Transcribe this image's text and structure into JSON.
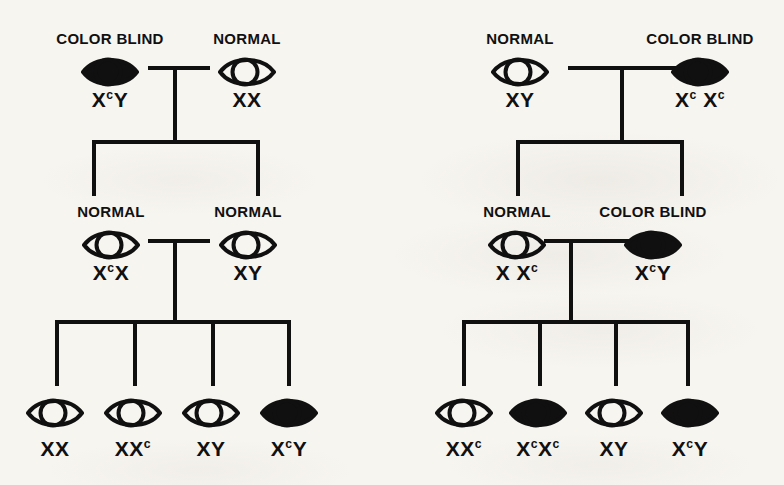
{
  "diagram": {
    "ink_color": "#111010",
    "paper_color": "#f7f5f0",
    "phenotype_labels": {
      "normal": "NORMAL",
      "color_blind": "COLOR BLIND"
    },
    "symbol_legend": {
      "open_eye": "normal vision",
      "filled_eye": "color blind"
    }
  },
  "pedigrees": [
    {
      "id": "left",
      "name": "pedigree-left",
      "generations": [
        {
          "id": "P",
          "individuals": [
            {
              "id": "left-p-father",
              "name": "color-blind-father",
              "phenotype": "COLOR BLIND",
              "genotype_main": "X",
              "genotype_sup": "c",
              "genotype_tail": "Y",
              "genotype_text": "XcY",
              "filled": true,
              "cx": 110,
              "eye_y": 55,
              "phen_y": 30,
              "geno_y": 88
            },
            {
              "id": "left-p-mother",
              "name": "normal-mother",
              "phenotype": "NORMAL",
              "genotype_main": "XX",
              "genotype_sup": "",
              "genotype_tail": "",
              "genotype_text": "XX",
              "filled": false,
              "cx": 247,
              "eye_y": 55,
              "phen_y": 30,
              "geno_y": 88
            }
          ]
        },
        {
          "id": "F1",
          "individuals": [
            {
              "id": "left-f1-mother",
              "name": "normal-carrier-daughter",
              "phenotype": "NORMAL",
              "genotype_main": "X",
              "genotype_sup": "c",
              "genotype_tail": "X",
              "genotype_text": "XcX",
              "filled": false,
              "cx": 111,
              "eye_y": 228,
              "phen_y": 203,
              "geno_y": 261
            },
            {
              "id": "left-f1-father",
              "name": "normal-father-in-law",
              "phenotype": "NORMAL",
              "genotype_main": "XY",
              "genotype_sup": "",
              "genotype_tail": "",
              "genotype_text": "XY",
              "filled": false,
              "cx": 248,
              "eye_y": 228,
              "phen_y": 203,
              "geno_y": 261
            }
          ]
        },
        {
          "id": "F2",
          "individuals": [
            {
              "id": "left-f2-child-1",
              "name": "normal-daughter",
              "phenotype": "",
              "genotype_main": "XX",
              "genotype_sup": "",
              "genotype_tail": "",
              "genotype_text": "XX",
              "filled": false,
              "cx": 55,
              "eye_y": 396,
              "geno_y": 437
            },
            {
              "id": "left-f2-child-2",
              "name": "carrier-daughter",
              "phenotype": "",
              "genotype_main": "XX",
              "genotype_sup": "c",
              "genotype_tail": "",
              "genotype_text": "XXc",
              "filled": false,
              "cx": 133,
              "eye_y": 396,
              "geno_y": 437
            },
            {
              "id": "left-f2-child-3",
              "name": "normal-son",
              "phenotype": "",
              "genotype_main": "XY",
              "genotype_sup": "",
              "genotype_tail": "",
              "genotype_text": "XY",
              "filled": false,
              "cx": 211,
              "eye_y": 396,
              "geno_y": 437
            },
            {
              "id": "left-f2-child-4",
              "name": "color-blind-son",
              "phenotype": "",
              "genotype_main": "X",
              "genotype_sup": "c",
              "genotype_tail": "Y",
              "genotype_text": "XcY",
              "filled": true,
              "cx": 289,
              "eye_y": 396,
              "geno_y": 437
            }
          ]
        }
      ]
    },
    {
      "id": "right",
      "name": "pedigree-right",
      "generations": [
        {
          "id": "P",
          "individuals": [
            {
              "id": "right-p-father",
              "name": "normal-father",
              "phenotype": "NORMAL",
              "genotype_main": "XY",
              "genotype_sup": "",
              "genotype_tail": "",
              "genotype_text": "XY",
              "filled": false,
              "cx": 520,
              "eye_y": 55,
              "phen_y": 30,
              "geno_y": 88
            },
            {
              "id": "right-p-mother",
              "name": "color-blind-mother",
              "phenotype": "COLOR BLIND",
              "genotype_main": "X",
              "genotype_sup": "c",
              "genotype_tail": " X",
              "genotype_sup2": "c",
              "genotype_text": "Xc Xc",
              "filled": true,
              "cx": 700,
              "eye_y": 55,
              "phen_y": 30,
              "geno_y": 88
            }
          ]
        },
        {
          "id": "F1",
          "individuals": [
            {
              "id": "right-f1-mother",
              "name": "normal-carrier-daughter",
              "phenotype": "NORMAL",
              "genotype_main": "X X",
              "genotype_sup": "c",
              "genotype_tail": "",
              "genotype_text": "X Xc",
              "filled": false,
              "cx": 517,
              "eye_y": 228,
              "phen_y": 203,
              "geno_y": 261
            },
            {
              "id": "right-f1-father",
              "name": "color-blind-father-in-law",
              "phenotype": "COLOR BLIND",
              "genotype_main": "X",
              "genotype_sup": "c",
              "genotype_tail": "Y",
              "genotype_text": "XcY",
              "filled": true,
              "cx": 653,
              "eye_y": 228,
              "phen_y": 203,
              "geno_y": 261
            }
          ]
        },
        {
          "id": "F2",
          "individuals": [
            {
              "id": "right-f2-child-1",
              "name": "carrier-daughter",
              "phenotype": "",
              "genotype_main": "XX",
              "genotype_sup": "c",
              "genotype_tail": "",
              "genotype_text": "XXc",
              "filled": false,
              "cx": 464,
              "eye_y": 396,
              "geno_y": 437
            },
            {
              "id": "right-f2-child-2",
              "name": "color-blind-daughter",
              "phenotype": "",
              "genotype_main": "X",
              "genotype_sup": "c",
              "genotype_tail": "X",
              "genotype_sup2": "c",
              "genotype_text": "XcXc",
              "filled": true,
              "cx": 538,
              "eye_y": 396,
              "geno_y": 437
            },
            {
              "id": "right-f2-child-3",
              "name": "normal-son",
              "phenotype": "",
              "genotype_main": "XY",
              "genotype_sup": "",
              "genotype_tail": "",
              "genotype_text": "XY",
              "filled": false,
              "cx": 614,
              "eye_y": 396,
              "geno_y": 437
            },
            {
              "id": "right-f2-child-4",
              "name": "color-blind-son",
              "phenotype": "",
              "genotype_main": "X",
              "genotype_sup": "c",
              "genotype_tail": "Y",
              "genotype_text": "XcY",
              "filled": true,
              "cx": 690,
              "eye_y": 396,
              "geno_y": 437
            }
          ]
        }
      ]
    }
  ]
}
